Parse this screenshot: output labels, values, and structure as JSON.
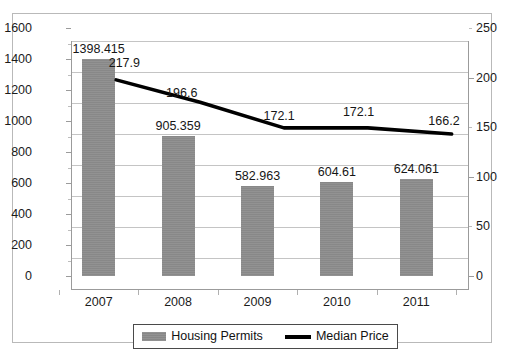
{
  "chart_data": {
    "type": "bar",
    "title": "",
    "subtitle": "",
    "xlabel": "",
    "ylabel": "",
    "categories": [
      "2007",
      "2008",
      "2009",
      "2010",
      "2011"
    ],
    "series": [
      {
        "name": "Housing Permits",
        "type": "bar",
        "axis": "left",
        "color": "#8d8d8d",
        "values": [
          1398.415,
          905.359,
          582.963,
          604.61,
          624.061
        ],
        "labels": [
          "1398.415",
          "905.359",
          "582.963",
          "604.61",
          "624.061"
        ]
      },
      {
        "name": "Median Price",
        "type": "line",
        "axis": "right",
        "color": "#000000",
        "values": [
          217.9,
          196.6,
          172.1,
          172.1,
          166.2
        ],
        "labels": [
          "217.9",
          "196.6",
          "172.1",
          "172.1",
          "166.2"
        ]
      }
    ],
    "left_axis": {
      "ylim": [
        0,
        1600
      ],
      "ticks": [
        0,
        200,
        400,
        600,
        800,
        1000,
        1200,
        1400,
        1600
      ],
      "tick_labels": [
        "0",
        "200",
        "400",
        "600",
        "800",
        "1000",
        "1200",
        "1400",
        "1600"
      ]
    },
    "right_axis": {
      "ylim": [
        0,
        250
      ],
      "ticks": [
        0,
        50,
        100,
        150,
        200,
        250
      ],
      "tick_labels": [
        "0",
        "50",
        "100",
        "150",
        "200",
        "250"
      ]
    },
    "grid": true,
    "legend": {
      "position": "bottom",
      "entries": [
        {
          "label": "Housing Permits",
          "marker": "bar-swatch"
        },
        {
          "label": "Median Price",
          "marker": "line-swatch"
        }
      ]
    }
  }
}
